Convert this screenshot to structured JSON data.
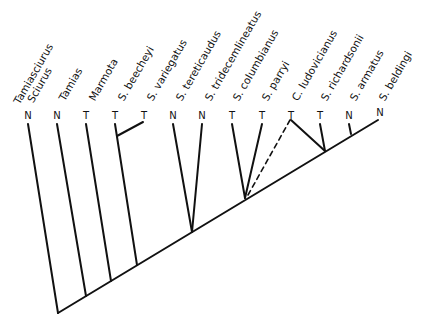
{
  "diagram": {
    "type": "phylogenetic-tree",
    "line_color": "#111111",
    "taxa": [
      {
        "label": "Tamiasciurus",
        "label2": "Sciurus",
        "state": "N"
      },
      {
        "label": "Tamias",
        "state": "N"
      },
      {
        "label": "Marmota",
        "state": "T"
      },
      {
        "label": "S. beecheyi",
        "state": "T"
      },
      {
        "label": "S. variegatus",
        "state": "T"
      },
      {
        "label": "S. tereticaudus",
        "state": "N"
      },
      {
        "label": "S. tridecemlineatus",
        "state": "N"
      },
      {
        "label": "S. columbianus",
        "state": "T"
      },
      {
        "label": "S. parryi",
        "state": "T"
      },
      {
        "label": "C. ludovicianus",
        "state": "T"
      },
      {
        "label": "S. richardsonii",
        "state": "T"
      },
      {
        "label": "S. armatus",
        "state": "N"
      },
      {
        "label": "S. beldingi",
        "state": "N"
      }
    ]
  }
}
